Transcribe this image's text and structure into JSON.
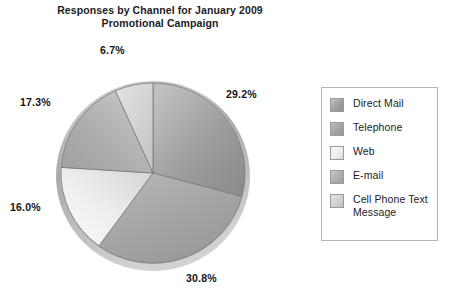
{
  "chart_data": {
    "type": "pie",
    "title": "Responses by Channel for January 2009 Promotional Campaign",
    "title_line1": "Responses by Channel for January 2009",
    "title_line2": "Promotional Campaign",
    "xlabel": "",
    "ylabel": "",
    "legend_position": "right",
    "grid": false,
    "start_angle_deg": 0,
    "direction": "clockwise",
    "categories": [
      "Direct Mail",
      "Telephone",
      "Web",
      "E-mail",
      "Cell Phone Text Message"
    ],
    "values": [
      29.2,
      30.8,
      16.0,
      17.3,
      6.7
    ],
    "labels": [
      "29.2%",
      "30.8%",
      "16.0%",
      "17.3%",
      "6.7%"
    ],
    "slice_colors": [
      "#9a9a9a",
      "#a3a3a3",
      "#ededed",
      "#b0b0b0",
      "#cfcfcf"
    ],
    "units": "percent"
  },
  "legend": {
    "items": [
      {
        "label": "Direct Mail",
        "color": "#9a9a9a"
      },
      {
        "label": "Telephone",
        "color": "#a3a3a3"
      },
      {
        "label": "Web",
        "color": "#ededed"
      },
      {
        "label": "E-mail",
        "color": "#b0b0b0"
      },
      {
        "label": "Cell Phone Text Message",
        "color": "#cfcfcf"
      }
    ]
  },
  "colors": {
    "background": "#ffffff",
    "text": "#1c1c1c",
    "legend_border": "#b4b4b4",
    "slice_outline": "#7a7a7a",
    "rim": "#b8b8b8"
  }
}
